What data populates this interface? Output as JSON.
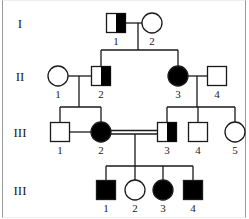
{
  "colors": {
    "line": "#1a1a1a",
    "affected": "#000000",
    "unaffected": "#ffffff"
  },
  "generations": [
    {
      "label": "I",
      "y": 23,
      "individuals": [
        {
          "id": "1",
          "sex": "male",
          "status": "carrier",
          "x": 116
        },
        {
          "id": "2",
          "sex": "female",
          "status": "unaffected",
          "x": 152
        }
      ]
    },
    {
      "label": "II",
      "y": 76,
      "individuals": [
        {
          "id": "1",
          "sex": "female",
          "status": "unaffected",
          "x": 58
        },
        {
          "id": "2",
          "sex": "male",
          "status": "carrier",
          "x": 101
        },
        {
          "id": "3",
          "sex": "female",
          "status": "affected",
          "x": 178
        },
        {
          "id": "4",
          "sex": "male",
          "status": "unaffected",
          "x": 217
        }
      ]
    },
    {
      "label": "III",
      "y": 132,
      "individuals": [
        {
          "id": "1",
          "sex": "male",
          "status": "unaffected",
          "x": 60
        },
        {
          "id": "2",
          "sex": "female",
          "status": "affected",
          "x": 101
        },
        {
          "id": "3",
          "sex": "male",
          "status": "carrier",
          "x": 167
        },
        {
          "id": "4",
          "sex": "male",
          "status": "unaffected",
          "x": 198
        },
        {
          "id": "5",
          "sex": "female",
          "status": "unaffected",
          "x": 235
        }
      ]
    },
    {
      "label": "III",
      "y": 190,
      "individuals": [
        {
          "id": "1",
          "sex": "male",
          "status": "affected",
          "x": 106
        },
        {
          "id": "2",
          "sex": "female",
          "status": "unaffected",
          "x": 135
        },
        {
          "id": "3",
          "sex": "female",
          "status": "affected",
          "x": 163
        },
        {
          "id": "4",
          "sex": "male",
          "status": "affected",
          "x": 193
        }
      ]
    }
  ],
  "relationships": [
    {
      "type": "mating",
      "between": [
        "I-1",
        "I-2"
      ]
    },
    {
      "type": "mating",
      "between": [
        "II-1",
        "II-2"
      ]
    },
    {
      "type": "mating",
      "between": [
        "II-3",
        "II-4"
      ]
    },
    {
      "type": "consanguineous-mating",
      "between": [
        "III-2",
        "III-3"
      ]
    }
  ]
}
